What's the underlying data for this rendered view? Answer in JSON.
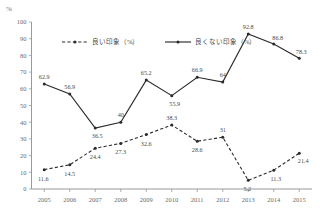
{
  "chart_data": {
    "type": "line",
    "title": "",
    "xlabel": "",
    "ylabel": "%",
    "unit_label": "%",
    "grid": false,
    "legend_position": "top-inside",
    "ylim": [
      0,
      100
    ],
    "ytick_step": 10,
    "yticks": [
      "0",
      "10",
      "20",
      "30",
      "40",
      "50",
      "60",
      "70",
      "80",
      "90",
      "100"
    ],
    "categories": [
      "2005",
      "2006",
      "2007",
      "2008",
      "2009",
      "2010",
      "2011",
      "2012",
      "2013",
      "2014",
      "2015"
    ],
    "series": [
      {
        "name": "良い印象（%）",
        "style": "dashed",
        "values": [
          11.6,
          14.5,
          24.4,
          27.3,
          32.6,
          38.3,
          28.6,
          31,
          5.2,
          11.3,
          21.4
        ],
        "labels": [
          "11.6",
          "14.5",
          "24.4",
          "27.3",
          "32.6",
          "38.3",
          "28.6",
          "31",
          "5.2",
          "11.3",
          "21.4"
        ]
      },
      {
        "name": "良くない印象（%）",
        "style": "solid",
        "values": [
          62.9,
          56.9,
          36.5,
          40,
          65.2,
          55.9,
          66.9,
          64,
          92.8,
          86.8,
          78.3
        ],
        "labels": [
          "62.9",
          "56.9",
          "36.5",
          "40",
          "65.2",
          "55.9",
          "66.9",
          "64",
          "92.8",
          "86.8",
          "78.3"
        ]
      }
    ]
  },
  "legend": {
    "items": [
      {
        "label": "良い印象（%）",
        "style": "dashed"
      },
      {
        "label": "良くない印象（%）",
        "style": "solid"
      }
    ]
  }
}
